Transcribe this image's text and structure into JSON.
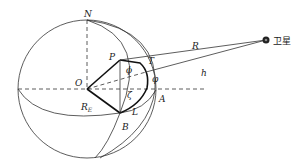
{
  "diagram": {
    "labels": {
      "north": "N",
      "center": "O",
      "point_p": "P",
      "point_t": "T",
      "point_a": "A",
      "point_b": "B",
      "point_l": "L",
      "angle_phi_upper": "ϕ",
      "angle_phi": "φ",
      "angle_zeta": "ζ",
      "range": "R",
      "height": "h",
      "earth_radius": "R",
      "earth_radius_sub": "E",
      "satellite": "卫星"
    },
    "colors": {
      "line": "#333333",
      "thick_line": "#111111",
      "satellite": "#222222"
    }
  }
}
